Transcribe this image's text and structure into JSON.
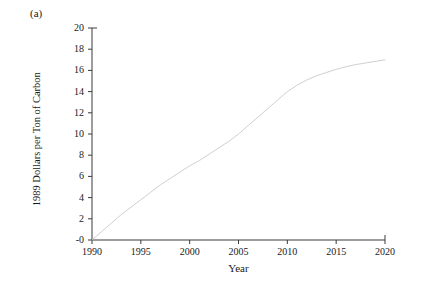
{
  "figure": {
    "panel_label": "(a)",
    "background_color": "#ffffff",
    "axis_color": "#3a3a3a",
    "curve_color": "#c9c9c9",
    "text_color": "#1a1a1a"
  },
  "chart_data": {
    "type": "line",
    "title": "",
    "subtitle": "",
    "xlabel": "Year",
    "ylabel": "1989 Dollars per Ton of Carbon",
    "xlim": [
      1990,
      2020
    ],
    "ylim": [
      0,
      20
    ],
    "xticks": [
      1990,
      1995,
      2000,
      2005,
      2010,
      2015,
      2020
    ],
    "xtick_labels": [
      "1990",
      "1995",
      "2000",
      "2005",
      "2010",
      "2015",
      "2020"
    ],
    "yticks": [
      0,
      2,
      4,
      6,
      8,
      10,
      12,
      14,
      16,
      18,
      20
    ],
    "ytick_labels": [
      "-0",
      "2",
      "4",
      "6",
      "8",
      "10",
      "12",
      "14",
      "16",
      "18",
      "20"
    ],
    "grid": false,
    "legend": null,
    "legend_position": "none",
    "spines": [
      "left",
      "bottom"
    ],
    "tick_direction": "out",
    "series": [
      {
        "name": "Carbon tax path",
        "color": "#c9c9c9",
        "linewidth": 0.9,
        "x": [
          1990,
          1991,
          1992,
          1993,
          1994,
          1995,
          1996,
          1997,
          1998,
          1999,
          2000,
          2001,
          2002,
          2003,
          2004,
          2005,
          2006,
          2007,
          2008,
          2009,
          2010,
          2011,
          2012,
          2013,
          2014,
          2015,
          2016,
          2017,
          2018,
          2019,
          2020
        ],
        "values": [
          0.0,
          0.8,
          1.6,
          2.4,
          3.1,
          3.8,
          4.5,
          5.2,
          5.8,
          6.4,
          7.0,
          7.5,
          8.1,
          8.7,
          9.3,
          10.0,
          10.8,
          11.6,
          12.4,
          13.2,
          14.0,
          14.6,
          15.1,
          15.5,
          15.8,
          16.1,
          16.35,
          16.55,
          16.7,
          16.85,
          17.0
        ]
      }
    ]
  }
}
